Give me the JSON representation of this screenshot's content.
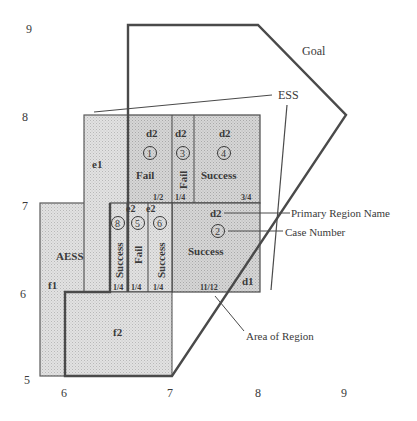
{
  "diagram": {
    "axes": {
      "y_ticks": [
        "9",
        "8",
        "7",
        "6",
        "5"
      ],
      "x_ticks": [
        "6",
        "7",
        "8",
        "9"
      ]
    },
    "labels": {
      "goal": "Goal",
      "ess": "ESS",
      "aess": "AESS",
      "primary_region_name": "Primary Region Name",
      "case_number": "Case Number",
      "area_of_region": "Area of Region"
    },
    "regions": {
      "e1": "e1",
      "f1": "f1",
      "f2": "f2",
      "d1": "d1"
    },
    "cases": [
      {
        "id": "1",
        "region": "d2",
        "result": "Fail",
        "area": "1/2"
      },
      {
        "id": "3",
        "region": "d2",
        "result": "Fail",
        "area": "1/4"
      },
      {
        "id": "4",
        "region": "d2",
        "result": "Success",
        "area": "3/4"
      },
      {
        "id": "8",
        "region": "",
        "result": "Success",
        "area": "1/4"
      },
      {
        "id": "5",
        "region": "e2",
        "result": "Fail",
        "area": "1/4"
      },
      {
        "id": "6",
        "region": "e2",
        "result": "Success",
        "area": "1/4"
      },
      {
        "id": "2",
        "region": "d2",
        "result": "Success",
        "area": "11/12"
      }
    ],
    "colors": {
      "outline": "#4a4a4a",
      "region_fill_light": "#dcdcdc",
      "region_fill_mid": "#cfcfcf",
      "text": "#3a3a3a"
    }
  }
}
